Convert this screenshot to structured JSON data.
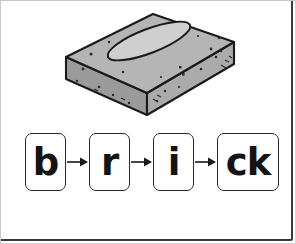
{
  "page": {
    "background_color": "#ffffff",
    "border_color": "#c9c9c9",
    "frame_color": "#3a3a3a"
  },
  "illustration": {
    "name": "brick-illustration",
    "alt_label": "brick",
    "outline_color": "#1a1a1a",
    "top_face_color": "#b3b3b3",
    "left_face_color": "#9e9e9e",
    "front_face_color": "#adadad",
    "frog_color": "#cfcfcf",
    "speckle_color": "#2a2a2a"
  },
  "word_breakdown": {
    "name": "phoneme-sequence",
    "word": "brick",
    "segments": [
      {
        "label": "b",
        "width": "narrow"
      },
      {
        "label": "r",
        "width": "narrow"
      },
      {
        "label": "i",
        "width": "narrow"
      },
      {
        "label": "ck",
        "width": "wide"
      }
    ],
    "connector": "arrow-right-icon",
    "connector_count": 3,
    "box_border_color": "#2b2b2b",
    "text_color": "#141414"
  }
}
